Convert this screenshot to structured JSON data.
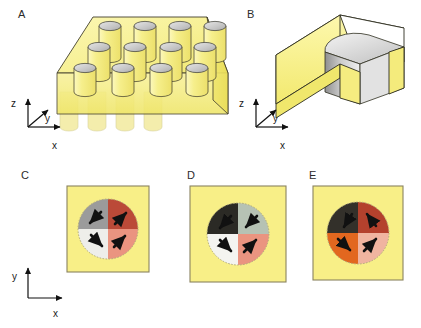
{
  "figure": {
    "background_color": "#ffffff",
    "width": 421,
    "height": 328
  },
  "panels": [
    {
      "id": "A",
      "letter": "A",
      "caption": "A",
      "type": "nanopillar-array",
      "description": "Three-dimensional yellow slab with a periodic array of vertical cylindrical pillars",
      "array_columns": 4,
      "array_rows": 3,
      "pillar_count": 12,
      "slab_color": "#f4ee7e",
      "slab_top_color": "#f7f2a0",
      "slab_side_color": "#f2e96a",
      "pillar_top_color": "#c9c9c9",
      "pillar_body_color": "#f0e87a",
      "outline_color": "#3a3a28",
      "axes": {
        "type": "3d",
        "labels": [
          "z",
          "y",
          "x"
        ],
        "z": "z",
        "y": "y",
        "x": "x"
      }
    },
    {
      "id": "B",
      "letter": "B",
      "caption": "B",
      "type": "unit-cell-cutaway",
      "description": "Magnified single unit cell, cut away to expose one gray cylinder embedded in the yellow matrix",
      "box_color": "#f6ef86",
      "box_front_color": "#f5ed74",
      "box_top_color": "#ffffff",
      "cylinder_color": "#d0d0d0",
      "cylinder_shade_color": "#b4b4b4",
      "outline_color": "#2e2e20",
      "axes": {
        "type": "3d",
        "labels": [
          "z",
          "y",
          "x"
        ],
        "z": "z",
        "y": "y",
        "x": "x"
      }
    },
    {
      "id": "C",
      "letter": "C",
      "caption": "C",
      "type": "magnetic-vortex-state",
      "description": "Top view of a disk in a flux-closure vortex state with four magnetic domains",
      "background_color": "#f8ef87",
      "border_color": "#8a8360",
      "quadrants": [
        {
          "position": "top-left",
          "color": "#9b9b9b",
          "arrow_direction": "down-left",
          "arrow_angle_deg": 225
        },
        {
          "position": "top-right",
          "color": "#bb4a38",
          "arrow_direction": "up-right",
          "arrow_angle_deg": 45
        },
        {
          "position": "bottom-left",
          "color": "#eeeeea",
          "arrow_direction": "down-right",
          "arrow_angle_deg": 315
        },
        {
          "position": "bottom-right",
          "color": "#ea9480",
          "arrow_direction": "up-right",
          "arrow_angle_deg": 45
        }
      ],
      "arrow_color": "#111111",
      "circulation": "counterclockwise"
    },
    {
      "id": "D",
      "letter": "D",
      "caption": "D",
      "type": "magnetic-vortex-state",
      "description": "Top view of a disk in a flux-closure vortex state with four magnetic domains",
      "background_color": "#f8ef87",
      "border_color": "#8a8360",
      "quadrants": [
        {
          "position": "top-left",
          "color": "#2b2a25",
          "arrow_direction": "down-left",
          "arrow_angle_deg": 225
        },
        {
          "position": "top-right",
          "color": "#b6c2b4",
          "arrow_direction": "up-left",
          "arrow_angle_deg": 135
        },
        {
          "position": "bottom-left",
          "color": "#f4f4f0",
          "arrow_direction": "down-right",
          "arrow_angle_deg": 315
        },
        {
          "position": "bottom-right",
          "color": "#ea9480",
          "arrow_direction": "up-right",
          "arrow_angle_deg": 45
        }
      ],
      "arrow_color": "#111111",
      "circulation": "counterclockwise"
    },
    {
      "id": "E",
      "letter": "E",
      "caption": "E",
      "type": "magnetic-vortex-state",
      "description": "Top view of a disk in a flux-closure vortex state with four magnetic domains",
      "background_color": "#f8ef87",
      "border_color": "#8a8360",
      "quadrants": [
        {
          "position": "top-left",
          "color": "#33302a",
          "arrow_direction": "down-left",
          "arrow_angle_deg": 225
        },
        {
          "position": "top-right",
          "color": "#b4412d",
          "arrow_direction": "up-right",
          "arrow_angle_deg": 45
        },
        {
          "position": "bottom-left",
          "color": "#e2671f",
          "arrow_direction": "down-right",
          "arrow_angle_deg": 315
        },
        {
          "position": "bottom-right",
          "color": "#f0b4a0",
          "arrow_direction": "up-right",
          "arrow_angle_deg": 45
        }
      ],
      "arrow_color": "#111111",
      "circulation": "counterclockwise"
    }
  ],
  "axes_indicators": [
    {
      "id": "axes-panel-a",
      "type": "3d",
      "z_label": "z",
      "y_label": "y",
      "x_label": "x"
    },
    {
      "id": "axes-panel-b",
      "type": "3d",
      "z_label": "z",
      "y_label": "y",
      "x_label": "x"
    },
    {
      "id": "axes-bottom-row",
      "type": "2d",
      "y_label": "y",
      "x_label": "x"
    }
  ]
}
